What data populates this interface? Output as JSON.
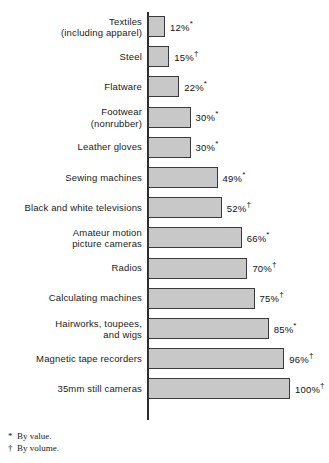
{
  "chart_data": {
    "type": "bar",
    "orientation": "horizontal",
    "title": "",
    "xlabel": "",
    "ylabel": "",
    "xlim": [
      0,
      100
    ],
    "grid": false,
    "legend": "none",
    "value_suffix": "%",
    "categories": [
      "Textiles\n(including apparel)",
      "Steel",
      "Flatware",
      "Footwear\n(nonrubber)",
      "Leather gloves",
      "Sewing machines",
      "Black and white televisions",
      "Amateur motion\npicture cameras",
      "Radios",
      "Calculating machines",
      "Hairworks, toupees,\nand wigs",
      "Magnetic tape recorders",
      "35mm still cameras"
    ],
    "values": [
      12,
      15,
      22,
      30,
      30,
      49,
      52,
      66,
      70,
      75,
      85,
      96,
      100
    ],
    "value_labels": [
      "12%",
      "15%",
      "22%",
      "30%",
      "30%",
      "49%",
      "52%",
      "66%",
      "70%",
      "75%",
      "85%",
      "96%",
      "100%"
    ],
    "footnote_marks": [
      "*",
      "†",
      "*",
      "*",
      "*",
      "*",
      "†",
      "*",
      "†",
      "†",
      "*",
      "†",
      "†"
    ],
    "bar_fill_color": "#c8c8c8",
    "bar_border_color": "#3a3a3a",
    "axis_color": "#2b2b2b",
    "background_color": "#ffffff"
  },
  "footnotes": [
    {
      "mark": "*",
      "text": "By value."
    },
    {
      "mark": "†",
      "text": "By volume."
    }
  ]
}
